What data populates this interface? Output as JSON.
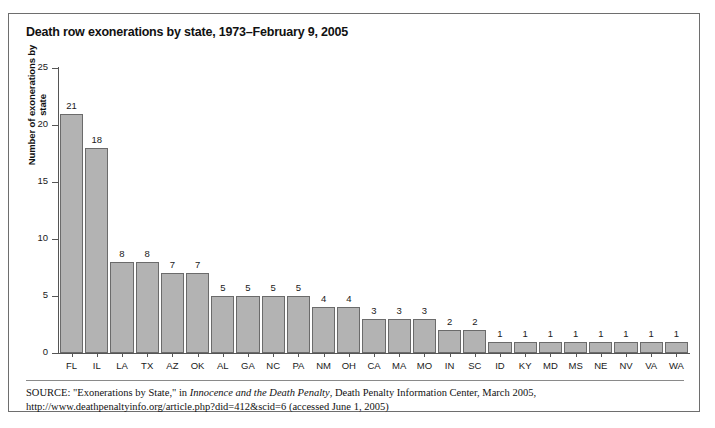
{
  "figure": {
    "title": "Death row exonerations by state, 1973–February 9, 2005",
    "source_label": "SOURCE:",
    "source_text_1": " \"Exonerations by State,\" in ",
    "source_italic": "Innocence and the Death Penalty",
    "source_text_2": ", Death Penalty Information Center, March 2005, http://www.deathpenaltyinfo.org/article.php?did=412&scid=6 (accessed June 1, 2005)"
  },
  "colors": {
    "bar_fill": "#b3b3b3",
    "bar_stroke": "#6b6b6b",
    "axis": "#555555",
    "frame": "#6e6e6e",
    "text": "#111111"
  },
  "chart_data": {
    "type": "bar",
    "title": "Death row exonerations by state, 1973–February 9, 2005",
    "xlabel": "",
    "ylabel": "Number of exonerations by state",
    "ylim": [
      0,
      25
    ],
    "yticks": [
      0,
      5,
      10,
      15,
      20,
      25
    ],
    "grid": false,
    "legend": false,
    "categories": [
      "FL",
      "IL",
      "LA",
      "TX",
      "AZ",
      "OK",
      "AL",
      "GA",
      "NC",
      "PA",
      "NM",
      "OH",
      "CA",
      "MA",
      "MO",
      "IN",
      "SC",
      "ID",
      "KY",
      "MD",
      "MS",
      "NE",
      "NV",
      "VA",
      "WA"
    ],
    "values": [
      21,
      18,
      8,
      8,
      7,
      7,
      5,
      5,
      5,
      5,
      4,
      4,
      3,
      3,
      3,
      2,
      2,
      1,
      1,
      1,
      1,
      1,
      1,
      1,
      1
    ],
    "data_labels": [
      "21",
      "18",
      "8",
      "8",
      "7",
      "7",
      "5",
      "5",
      "5",
      "5",
      "4",
      "4",
      "3",
      "3",
      "3",
      "2",
      "2",
      "1",
      "1",
      "1",
      "1",
      "1",
      "1",
      "1",
      "1"
    ]
  }
}
